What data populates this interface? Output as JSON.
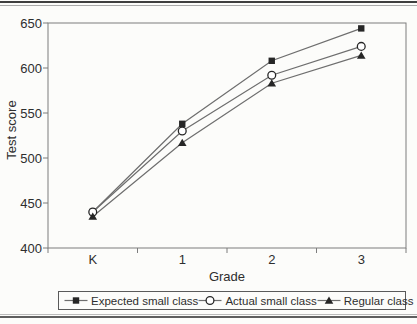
{
  "chart_data": {
    "type": "line",
    "title": "",
    "xlabel": "Grade",
    "ylabel": "Test score",
    "categories": [
      "K",
      "1",
      "2",
      "3"
    ],
    "yticks": [
      400,
      450,
      500,
      550,
      600,
      650
    ],
    "ylim": [
      400,
      650
    ],
    "grid": false,
    "legend_position": "bottom",
    "series": [
      {
        "name": "Expected small class",
        "marker": "square",
        "values": [
          440,
          538,
          608,
          644
        ]
      },
      {
        "name": "Actual small class",
        "marker": "circle-open",
        "values": [
          440,
          530,
          592,
          624
        ]
      },
      {
        "name": "Regular class",
        "marker": "triangle",
        "values": [
          435,
          517,
          583,
          614
        ]
      }
    ],
    "colors": {
      "line": "#6e6e6e",
      "marker": "#262626",
      "axis": "#7d7d7d",
      "text": "#2e2e2e"
    }
  }
}
